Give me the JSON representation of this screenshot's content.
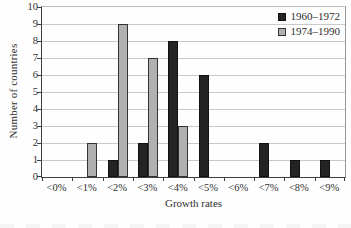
{
  "chart_data": {
    "type": "bar",
    "title": "",
    "categories": [
      "<0%",
      "<1%",
      "<2%",
      "<3%",
      "<4%",
      "<5%",
      "<6%",
      "<7%",
      "<8%",
      "<9%"
    ],
    "series": [
      {
        "name": "1960–1972",
        "color": "#242424",
        "border": "#111111",
        "values": [
          0,
          0,
          1,
          2,
          8,
          6,
          0,
          2,
          1,
          1
        ]
      },
      {
        "name": "1974–1990",
        "color": "#b0b0b0",
        "border": "#333333",
        "values": [
          0,
          2,
          9,
          7,
          3,
          0,
          0,
          0,
          0,
          0
        ]
      }
    ],
    "xlabel": "Growth rates",
    "ylabel": "Number of countries",
    "ylim": [
      0,
      10
    ],
    "y_ticks": [
      "0",
      "1",
      "2",
      "3",
      "4",
      "5",
      "6",
      "7",
      "8",
      "9",
      "10"
    ],
    "grid": true,
    "legend_position": "top-right"
  },
  "colors": {
    "background": "#fefefe",
    "axis": "#3f3f3f",
    "gridline": "#c9c9c9",
    "text": "#2e2e2e"
  }
}
